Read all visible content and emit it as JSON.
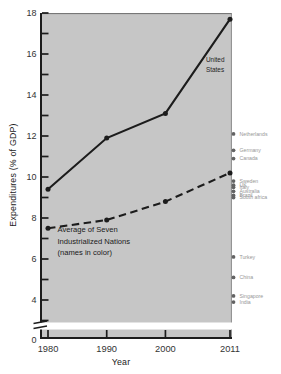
{
  "figure": {
    "plot_bg_color": "#c6c6c6",
    "ink_color": "#1c1c1c",
    "tick_label_color": "#333333",
    "country_label_color": "#979797",
    "country_dot_color": "#636363",
    "annotation_color": "#202020"
  },
  "chart_data": {
    "type": "line",
    "title": "",
    "xlabel": "Year",
    "ylabel": "Expenditures (% of GDP)",
    "x": [
      1980,
      1990,
      2000,
      2011
    ],
    "x_tick_labels": [
      "1980",
      "1990",
      "2000",
      "2011"
    ],
    "y_axis": {
      "labeled_ticks": [
        18,
        16,
        14,
        12,
        10,
        8,
        6,
        4
      ],
      "minor_ticks": [
        17,
        15,
        13,
        11,
        9,
        7,
        5,
        3
      ],
      "origin_label": "0",
      "axis_break": true,
      "range_shown": [
        3,
        18
      ]
    },
    "grid": false,
    "series": [
      {
        "name": "United States",
        "line_style": "solid",
        "color": "#1c1c1c",
        "values": [
          9.4,
          11.9,
          13.1,
          17.7
        ]
      },
      {
        "name": "Average of Seven Industrialized Nations",
        "line_style": "dashed",
        "color": "#1c1c1c",
        "values": [
          7.5,
          7.9,
          8.8,
          10.2
        ]
      }
    ],
    "side_points_2011": [
      {
        "label": "Netherlands",
        "value": 12.1
      },
      {
        "label": "Germany",
        "value": 11.3
      },
      {
        "label": "Canada",
        "value": 10.9
      },
      {
        "label": "Sweden",
        "value": 9.8
      },
      {
        "label": "UK",
        "value": 9.6
      },
      {
        "label": "Italy",
        "value": 9.5
      },
      {
        "label": "Australia",
        "value": 9.3
      },
      {
        "label": "Brazil",
        "value": 9.1
      },
      {
        "label": "South africa",
        "value": 9.0
      },
      {
        "label": "Turkey",
        "value": 6.1
      },
      {
        "label": "China",
        "value": 5.1
      },
      {
        "label": "Singapore",
        "value": 4.2
      },
      {
        "label": "India",
        "value": 3.9
      }
    ],
    "annotations": [
      {
        "id": "us",
        "lines": [
          "United",
          "States"
        ]
      },
      {
        "id": "avg",
        "lines": [
          "Average of Seven",
          "Industrialized Nations",
          "(names in color)"
        ]
      }
    ]
  }
}
